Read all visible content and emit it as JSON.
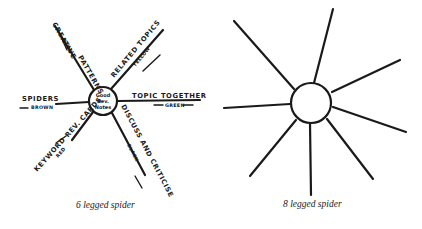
{
  "diagrams": [
    {
      "caption": "6 legged spider",
      "center": {
        "lines": [
          "Good",
          "Rev.",
          "Notes"
        ]
      },
      "legs": [
        {
          "label": "CREATIVE",
          "sublabel": "BLUE",
          "label2": "PATTERNS"
        },
        {
          "label": "RELATED TOPICS",
          "sublabel": "YELLOW"
        },
        {
          "label": "SPIDERS",
          "sublabel": "BROWN"
        },
        {
          "label": "TOPIC TOGETHER",
          "sublabel": "GREEN"
        },
        {
          "label": "KEYWORD REV. CARDS",
          "sublabel": "RED"
        },
        {
          "label": "DISCUSS AND CRITICISE",
          "sublabel": "BLACK"
        }
      ]
    },
    {
      "caption": "8 legged spider",
      "legs_count": 8
    }
  ],
  "colors": {
    "ink": "#1a1a1a",
    "background": "#ffffff"
  }
}
